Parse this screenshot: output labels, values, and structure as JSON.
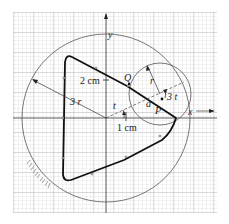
{
  "diagram": {
    "type": "geometric-construction",
    "background": "graph-paper",
    "colors": {
      "paper": "#ffffff",
      "grid_minor": "#c9c9c9",
      "grid_major": "#a8a8a8",
      "ink": "#1a1a1a",
      "circle": "#555555"
    },
    "axes": {
      "x_label": "x",
      "y_label": "y"
    },
    "labels": {
      "two_cm": "2 cm",
      "one_cm": "1 cm",
      "three_r": "3 r",
      "r": "r",
      "t_left": "t",
      "a": "a",
      "three_t": "3 t",
      "P": "P",
      "Q": "Q"
    },
    "shapes": {
      "large_circle": "fixed circle of radius 3r (hatched at lower-left, indicating fixed)",
      "small_circle": "rolling circle of radius r",
      "curve": "hypocycloid-like trefoil traced by point P (thick line)"
    }
  }
}
